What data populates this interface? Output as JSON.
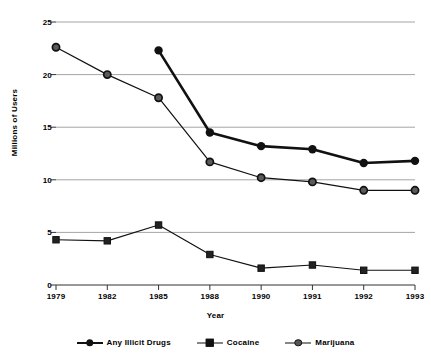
{
  "chart_data": {
    "type": "line",
    "title": "",
    "xlabel": "Year",
    "ylabel": "Millions of Users",
    "categories": [
      "1979",
      "1982",
      "1985",
      "1988",
      "1990",
      "1991",
      "1992",
      "1993"
    ],
    "yticks": [
      "0",
      "5",
      "10",
      "15",
      "20",
      "25"
    ],
    "ylim": [
      0,
      25
    ],
    "grid": "horizontal",
    "legend_position": "bottom",
    "series": [
      {
        "name": "Any Illicit Drugs",
        "marker": "circle-solid",
        "color": "#111111",
        "values": [
          null,
          null,
          22.3,
          14.5,
          13.2,
          12.9,
          11.6,
          11.8
        ]
      },
      {
        "name": "Cocaine",
        "marker": "square-solid",
        "color": "#111111",
        "values": [
          4.3,
          4.2,
          5.7,
          2.9,
          1.6,
          1.9,
          1.4,
          1.4
        ]
      },
      {
        "name": "Marijuana",
        "marker": "circle-ring",
        "color": "#111111",
        "values": [
          22.6,
          20.0,
          17.8,
          11.7,
          10.2,
          9.8,
          9.0,
          9.0
        ]
      }
    ]
  },
  "legend": {
    "items": [
      {
        "label": "Any Illicit Drugs"
      },
      {
        "label": "Cocaine"
      },
      {
        "label": "Marijuana"
      }
    ]
  },
  "axes": {
    "y_title": "Millions of Users",
    "x_title": "Year"
  }
}
